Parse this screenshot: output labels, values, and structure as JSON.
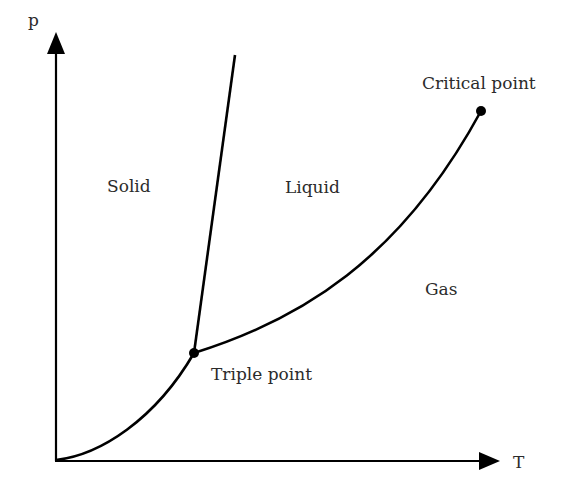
{
  "diagram": {
    "axes": {
      "x_label": "T",
      "y_label": "p"
    },
    "regions": {
      "solid": "Solid",
      "liquid": "Liquid",
      "gas": "Gas"
    },
    "points": {
      "triple": "Triple point",
      "critical": "Critical point"
    },
    "curves": {
      "sublimation": "solid-gas boundary (origin to triple point)",
      "melting": "solid-liquid boundary (triple point upward)",
      "vaporization": "liquid-gas boundary (triple point to critical point)"
    },
    "colors": {
      "line": "#000000",
      "text": "#2b2b2b",
      "background": "#ffffff"
    }
  }
}
